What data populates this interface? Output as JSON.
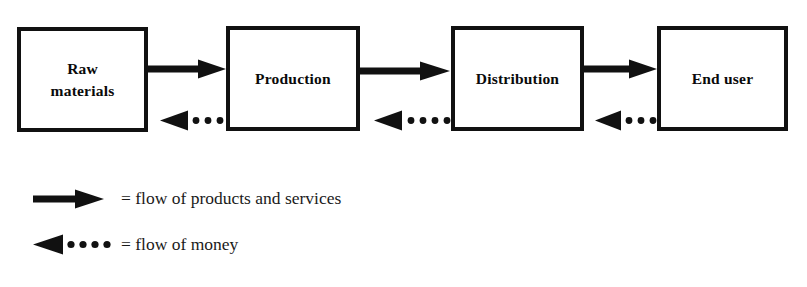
{
  "diagram": {
    "background_color": "#ffffff",
    "stroke_color": "#111111",
    "nodes": [
      {
        "id": "raw-materials",
        "label": "Raw\nmaterials",
        "x": 17,
        "y": 27,
        "width": 131,
        "height": 105
      },
      {
        "id": "production",
        "label": "Production",
        "x": 226,
        "y": 26,
        "width": 134,
        "height": 105
      },
      {
        "id": "distribution",
        "label": "Distribution",
        "x": 451,
        "y": 26,
        "width": 133,
        "height": 105
      },
      {
        "id": "end-user",
        "label": "End user",
        "x": 657,
        "y": 26,
        "width": 131,
        "height": 105
      }
    ],
    "connectors": [
      {
        "id": "flow-products-1",
        "from": "raw-materials",
        "to": "production",
        "style": "solid",
        "direction": "right",
        "x": 148,
        "y": 60,
        "width": 78,
        "height": 18
      },
      {
        "id": "flow-money-1",
        "from": "production",
        "to": "raw-materials",
        "style": "dotted",
        "direction": "left",
        "x": 160,
        "y": 110,
        "width": 66,
        "height": 20,
        "dots": 3
      },
      {
        "id": "flow-products-2",
        "from": "production",
        "to": "distribution",
        "style": "solid",
        "direction": "right",
        "x": 360,
        "y": 60,
        "width": 91,
        "height": 18
      },
      {
        "id": "flow-money-2",
        "from": "distribution",
        "to": "production",
        "style": "dotted",
        "direction": "left",
        "x": 375,
        "y": 110,
        "width": 76,
        "height": 20,
        "dots": 4
      },
      {
        "id": "flow-products-3",
        "from": "distribution",
        "to": "end-user",
        "style": "solid",
        "direction": "right",
        "x": 584,
        "y": 60,
        "width": 73,
        "height": 18
      },
      {
        "id": "flow-money-3",
        "from": "end-user",
        "to": "distribution",
        "style": "dotted",
        "direction": "left",
        "x": 595,
        "y": 110,
        "width": 62,
        "height": 20,
        "dots": 3
      }
    ]
  },
  "legend": {
    "items": [
      {
        "id": "flow-of-products-and-services",
        "glyph": "solid-arrow-right-icon",
        "text": "= flow of products and services"
      },
      {
        "id": "flow-of-money",
        "glyph": "dotted-arrow-left-icon",
        "text": "= flow of money"
      }
    ]
  }
}
